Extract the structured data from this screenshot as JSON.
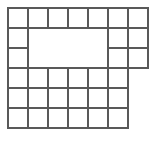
{
  "figure": {
    "name": "grid-polyomino-diagram",
    "type": "diagram",
    "background_color": "#ffffff",
    "line_color": "#595959",
    "line_width": 2,
    "fill_color": "#ffffff",
    "canvas": {
      "width": 151,
      "height": 143
    },
    "geometry": {
      "unit_cell_width": 20,
      "unit_cell_height": 20,
      "origin_x": 8,
      "origin_y": 8,
      "columns": 7,
      "rows": 6,
      "column_x": [
        8,
        28,
        48,
        68,
        88,
        108,
        128,
        148
      ],
      "row_y": [
        8,
        28,
        48,
        68,
        88,
        108,
        128
      ]
    },
    "cells": [
      {
        "col": 1,
        "row": 1,
        "filled": true
      },
      {
        "col": 2,
        "row": 1,
        "filled": true
      },
      {
        "col": 3,
        "row": 1,
        "filled": true
      },
      {
        "col": 4,
        "row": 1,
        "filled": true
      },
      {
        "col": 5,
        "row": 1,
        "filled": true
      },
      {
        "col": 6,
        "row": 1,
        "filled": true
      },
      {
        "col": 7,
        "row": 1,
        "filled": true
      },
      {
        "col": 1,
        "row": 2,
        "filled": true
      },
      {
        "col": 2,
        "row": 2,
        "filled": false
      },
      {
        "col": 3,
        "row": 2,
        "filled": false
      },
      {
        "col": 4,
        "row": 2,
        "filled": false
      },
      {
        "col": 5,
        "row": 2,
        "filled": false
      },
      {
        "col": 6,
        "row": 2,
        "filled": true
      },
      {
        "col": 7,
        "row": 2,
        "filled": true
      },
      {
        "col": 1,
        "row": 3,
        "filled": true
      },
      {
        "col": 2,
        "row": 3,
        "filled": false
      },
      {
        "col": 3,
        "row": 3,
        "filled": false
      },
      {
        "col": 4,
        "row": 3,
        "filled": false
      },
      {
        "col": 5,
        "row": 3,
        "filled": false
      },
      {
        "col": 6,
        "row": 3,
        "filled": true
      },
      {
        "col": 7,
        "row": 3,
        "filled": true
      },
      {
        "col": 1,
        "row": 4,
        "filled": true
      },
      {
        "col": 2,
        "row": 4,
        "filled": true
      },
      {
        "col": 3,
        "row": 4,
        "filled": true
      },
      {
        "col": 4,
        "row": 4,
        "filled": true
      },
      {
        "col": 5,
        "row": 4,
        "filled": true
      },
      {
        "col": 6,
        "row": 4,
        "filled": true
      },
      {
        "col": 7,
        "row": 4,
        "filled": false
      },
      {
        "col": 1,
        "row": 5,
        "filled": true
      },
      {
        "col": 2,
        "row": 5,
        "filled": true
      },
      {
        "col": 3,
        "row": 5,
        "filled": true
      },
      {
        "col": 4,
        "row": 5,
        "filled": true
      },
      {
        "col": 5,
        "row": 5,
        "filled": true
      },
      {
        "col": 6,
        "row": 5,
        "filled": true
      },
      {
        "col": 7,
        "row": 5,
        "filled": false
      },
      {
        "col": 1,
        "row": 6,
        "filled": true
      },
      {
        "col": 2,
        "row": 6,
        "filled": true
      },
      {
        "col": 3,
        "row": 6,
        "filled": true
      },
      {
        "col": 4,
        "row": 6,
        "filled": true
      },
      {
        "col": 5,
        "row": 6,
        "filled": true
      },
      {
        "col": 6,
        "row": 6,
        "filled": true
      },
      {
        "col": 7,
        "row": 6,
        "filled": false
      }
    ],
    "hole": {
      "name": "interior-empty-rectangle",
      "col_start": 2,
      "col_end": 5,
      "row_start": 2,
      "row_end": 3
    },
    "counts": {
      "filled_cells": 34,
      "empty_cells": 8
    }
  }
}
